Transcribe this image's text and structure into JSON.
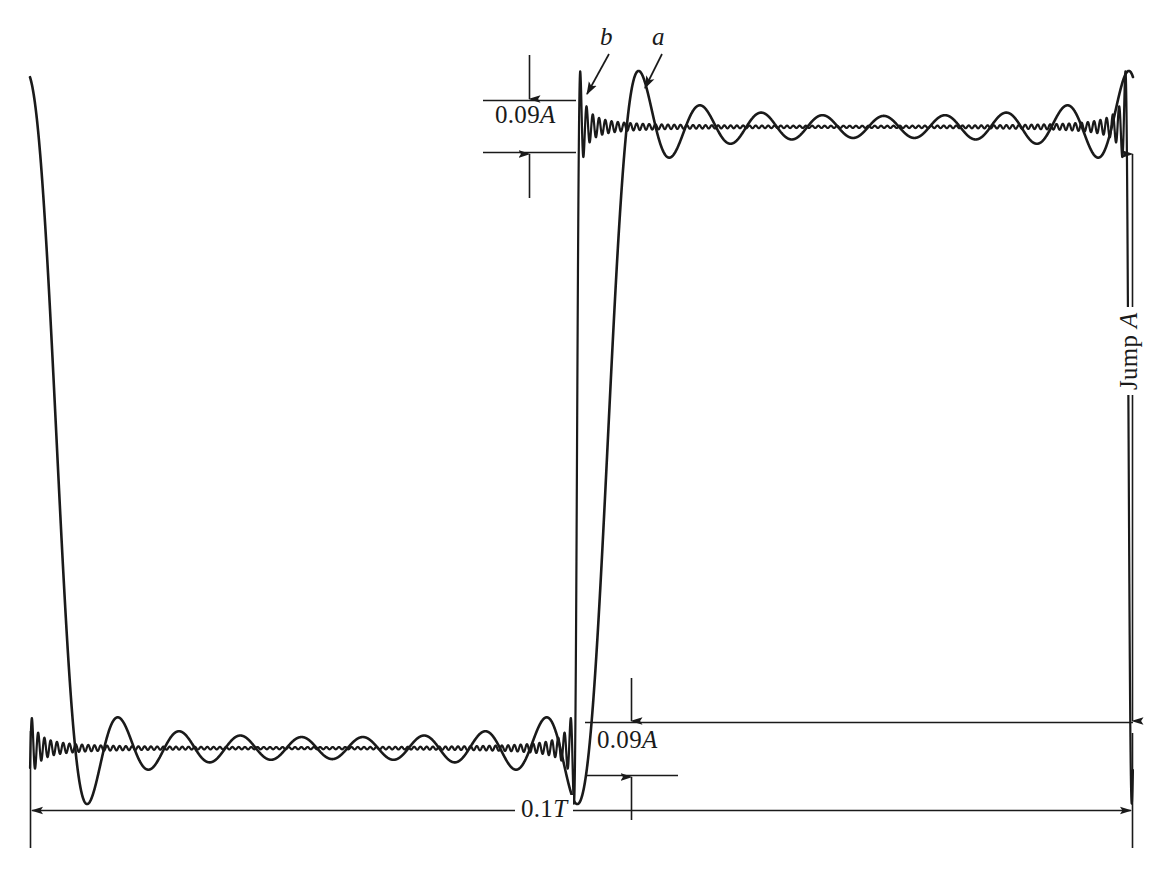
{
  "figure": {
    "background_color": "#ffffff",
    "ink_color": "#1a1a1a"
  },
  "annotations": {
    "overshoot_top": {
      "value": "0.09",
      "symbol": "A",
      "name": "upper overshoot dimension"
    },
    "overshoot_bottom": {
      "value": "0.09",
      "symbol": "A",
      "name": "lower undershoot dimension"
    },
    "span_horizontal": {
      "value": "0.1",
      "symbol": "T",
      "name": "horizontal time span"
    },
    "jump": {
      "prefix": "Jump ",
      "symbol": "A",
      "name": "vertical jump height"
    }
  },
  "curve_labels": [
    {
      "id": "b",
      "label": "b",
      "description": "high-order partial sum, fast ripple"
    },
    {
      "id": "a",
      "label": "a",
      "description": "low-order partial sum, slow ripple"
    }
  ],
  "chart_data": {
    "type": "line",
    "xlabel": "",
    "ylabel": "",
    "grid": false,
    "legend": "inline-leader-labels",
    "xlim": [
      0,
      1
    ],
    "ylim": [
      -0.09,
      1.09
    ],
    "axis_units": {
      "x": "0.1T full width",
      "y": "A full jump"
    },
    "jump_location_x": 0.52,
    "levels": {
      "low": 0.0,
      "high": 1.0
    },
    "overshoot_fraction": 0.09,
    "undershoot_fraction": 0.09,
    "series": [
      {
        "name": "a",
        "harmonics_relative": "low",
        "ripple_period_x": 0.062,
        "peak_overshoot": 0.09,
        "peak_x": 0.549,
        "description": "Partial sum with fewer terms: slow, wide ripple lobes decaying away from the discontinuity"
      },
      {
        "name": "b",
        "harmonics_relative": "high",
        "ripple_period_x": 0.0057,
        "peak_overshoot": 0.09,
        "peak_x": 0.497,
        "description": "Partial sum with many terms: fast, narrow ripple lobes hugging the discontinuity"
      }
    ]
  }
}
